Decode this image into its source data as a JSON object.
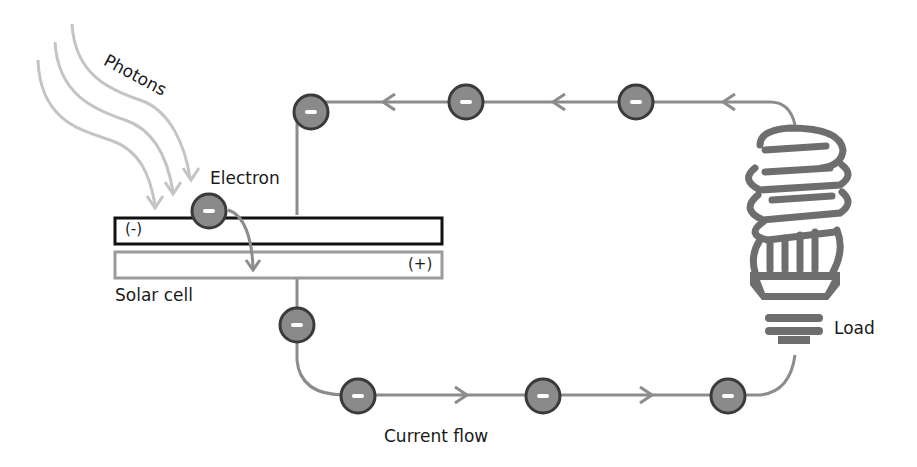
{
  "labels": {
    "photons": "Photons",
    "electron": "Electron",
    "negative_layer": "(-)",
    "positive_layer": "(+)",
    "solar_cell": "Solar cell",
    "load": "Load",
    "current_flow": "Current flow"
  },
  "electron_symbol": "-",
  "colors": {
    "wire": "#8c8c8c",
    "photon": "#c4c4c4",
    "electron_fill": "#8a8a8a",
    "electron_stroke": "#3a3a3a",
    "bulb": "#6e6e6e",
    "neg_layer_border": "#111111",
    "pos_layer_border": "#9a9a9a"
  }
}
